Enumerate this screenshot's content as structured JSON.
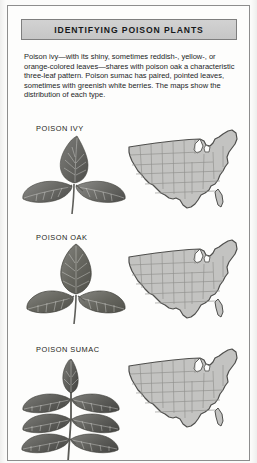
{
  "panel": {
    "title": "IDENTIFYING POISON PLANTS",
    "description": "Poison ivy—with its shiny, sometimes reddish-, yellow-, or orange-colored leaves—shares with poison oak a characteristic three-leaf pattern. Poison sumac has paired, pointed leaves, sometimes with greenish white berries. The maps show the distribution of each type."
  },
  "colors": {
    "title_bar_fill": "#cccccc",
    "title_bar_border": "#7e7e7e",
    "frame_border": "#8d8d8d",
    "page_background": "#fdfdfc",
    "leaf_dark": "#5a5a58",
    "leaf_mid": "#6f6f6c",
    "leaf_light": "#878784",
    "map_fill": "#c3c3c1",
    "map_outline": "#5e5e5c",
    "map_state_line": "#8f8f8d",
    "text": "#232527"
  },
  "entries": [
    {
      "label": "POISON IVY",
      "leaf_icon": "poison-ivy-leaf",
      "map_icon": "us-distribution-map",
      "leaflet_count": 3,
      "leaf_shape": "pointed-oval-trifoliate"
    },
    {
      "label": "POISON OAK",
      "leaf_icon": "poison-oak-leaf",
      "map_icon": "us-distribution-map",
      "leaflet_count": 3,
      "leaf_shape": "lobed-scalloped-trifoliate"
    },
    {
      "label": "POISON SUMAC",
      "leaf_icon": "poison-sumac-leaf",
      "map_icon": "us-distribution-map",
      "leaflet_count": 9,
      "leaf_shape": "pinnate-compound-paired"
    }
  ]
}
